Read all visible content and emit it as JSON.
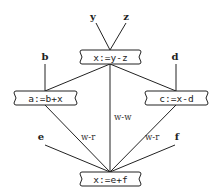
{
  "diagram": {
    "nodes": [
      {
        "id": "n1",
        "label": "x:=y-z",
        "x": 80,
        "y": 50,
        "w": 61,
        "h": 14
      },
      {
        "id": "n2",
        "label": "a:=b+x",
        "x": 14,
        "y": 91,
        "w": 63,
        "h": 14
      },
      {
        "id": "n3",
        "label": "c:=x-d",
        "x": 145,
        "y": 91,
        "w": 63,
        "h": 14
      },
      {
        "id": "n4",
        "label": "x:=e+f",
        "x": 80,
        "y": 172,
        "w": 61,
        "h": 14
      }
    ],
    "inputs": [
      {
        "id": "y",
        "label": "y",
        "x": 93,
        "y": 20
      },
      {
        "id": "z",
        "label": "z",
        "x": 126,
        "y": 20
      },
      {
        "id": "b",
        "label": "b",
        "x": 45,
        "y": 60
      },
      {
        "id": "d",
        "label": "d",
        "x": 175,
        "y": 60
      },
      {
        "id": "e",
        "label": "e",
        "x": 41,
        "y": 140
      },
      {
        "id": "f",
        "label": "f",
        "x": 177,
        "y": 140
      }
    ],
    "edge_labels": [
      {
        "id": "lbl-left",
        "label": "w-r",
        "x": 81,
        "y": 140
      },
      {
        "id": "lbl-center",
        "label": "w-w",
        "x": 114,
        "y": 120
      },
      {
        "id": "lbl-right",
        "label": "w-r",
        "x": 145,
        "y": 140
      }
    ]
  }
}
